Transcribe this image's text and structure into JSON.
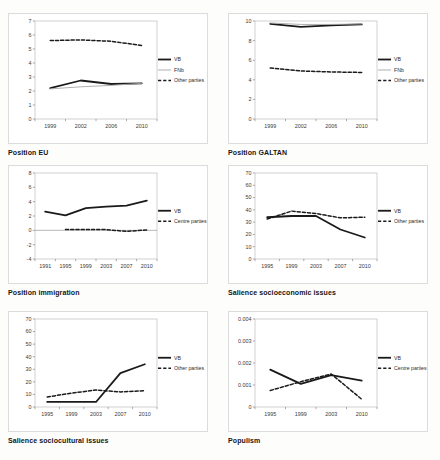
{
  "page": {
    "background_color": "#fdfdfc",
    "figure_type": "2x3 grid of line charts"
  },
  "chart_data": [
    {
      "type": "line",
      "title": "Position EU",
      "x": [
        "1999",
        "2002",
        "2006",
        "2010"
      ],
      "ylim": [
        0,
        7
      ],
      "ytick_values": [
        0,
        1,
        2,
        3,
        4,
        5,
        6,
        7
      ],
      "ytick_labels": [
        "0",
        "1",
        "2",
        "3",
        "4",
        "5",
        "6",
        "7"
      ],
      "grid": false,
      "legend_position": "right",
      "series": [
        {
          "name": "VB",
          "values": [
            2.2,
            2.75,
            2.5,
            2.55
          ],
          "color": "#1a1a1a",
          "width": 1.8,
          "dash": null
        },
        {
          "name": "FNb",
          "values": [
            2.15,
            2.3,
            2.4,
            2.55
          ],
          "color": "#a6a6a6",
          "width": 0.9,
          "dash": null
        },
        {
          "name": "Other parties",
          "values": [
            5.6,
            5.65,
            5.55,
            5.25
          ],
          "color": "#1a1a1a",
          "width": 1.5,
          "dash": "3.2,2"
        }
      ]
    },
    {
      "type": "line",
      "title": "Position GALTAN",
      "x": [
        "1999",
        "2002",
        "2006",
        "2010"
      ],
      "ylim": [
        0,
        10
      ],
      "ytick_values": [
        0,
        2,
        4,
        6,
        8,
        10
      ],
      "ytick_labels": [
        "0",
        "2",
        "4",
        "6",
        "8",
        "10"
      ],
      "grid": false,
      "legend_position": "right",
      "series": [
        {
          "name": "VB",
          "values": [
            9.7,
            9.4,
            9.55,
            9.65
          ],
          "color": "#1a1a1a",
          "width": 1.8,
          "dash": null
        },
        {
          "name": "FNb",
          "values": [
            9.8,
            9.65,
            9.65,
            9.7
          ],
          "color": "#a6a6a6",
          "width": 0.9,
          "dash": null
        },
        {
          "name": "Other parties",
          "values": [
            5.2,
            4.9,
            4.8,
            4.75
          ],
          "color": "#1a1a1a",
          "width": 1.5,
          "dash": "3.2,2"
        }
      ]
    },
    {
      "type": "line",
      "title": "Position immigration",
      "x": [
        "1991",
        "1995",
        "1999",
        "2003",
        "2007",
        "2010"
      ],
      "ylim": [
        -4,
        8
      ],
      "ytick_values": [
        -4,
        -2,
        0,
        2,
        4,
        6,
        8
      ],
      "ytick_labels": [
        "-4",
        "-2",
        "0",
        "2",
        "4",
        "6",
        "8"
      ],
      "grid": false,
      "legend_position": "right",
      "series": [
        {
          "name": "VB",
          "values": [
            2.6,
            2.1,
            3.1,
            3.3,
            3.45,
            4.15
          ],
          "color": "#1a1a1a",
          "width": 1.8,
          "dash": null
        },
        {
          "name": "Centre parties",
          "values": [
            null,
            0.1,
            0.1,
            0.1,
            -0.15,
            0.05
          ],
          "color": "#1a1a1a",
          "width": 1.5,
          "dash": "3.2,2"
        }
      ]
    },
    {
      "type": "line",
      "title": "Salience socioeconomic issues",
      "x": [
        "1995",
        "1999",
        "2003",
        "2007",
        "2010"
      ],
      "ylim": [
        0,
        70
      ],
      "ytick_values": [
        0,
        10,
        20,
        30,
        40,
        50,
        60,
        70
      ],
      "ytick_labels": [
        "0",
        "10",
        "20",
        "30",
        "40",
        "50",
        "60",
        "70"
      ],
      "grid": false,
      "legend_position": "right",
      "series": [
        {
          "name": "VB",
          "values": [
            34,
            35,
            35,
            24,
            17.5
          ],
          "color": "#1a1a1a",
          "width": 1.8,
          "dash": null
        },
        {
          "name": "Other parties",
          "values": [
            32.5,
            39,
            37,
            33.5,
            34
          ],
          "color": "#1a1a1a",
          "width": 1.5,
          "dash": "3.2,2"
        }
      ]
    },
    {
      "type": "line",
      "title": "Salience sociocultural issues",
      "x": [
        "1995",
        "1999",
        "2003",
        "2007",
        "2010"
      ],
      "ylim": [
        0,
        70
      ],
      "ytick_values": [
        0,
        10,
        20,
        30,
        40,
        50,
        60,
        70
      ],
      "ytick_labels": [
        "0",
        "10",
        "20",
        "30",
        "40",
        "50",
        "60",
        "70"
      ],
      "grid": false,
      "legend_position": "right",
      "series": [
        {
          "name": "VB",
          "values": [
            4,
            4,
            4,
            27,
            34
          ],
          "color": "#1a1a1a",
          "width": 1.8,
          "dash": null
        },
        {
          "name": "Other parties",
          "values": [
            8,
            11,
            13.5,
            12,
            13
          ],
          "color": "#1a1a1a",
          "width": 1.5,
          "dash": "3.2,2"
        }
      ]
    },
    {
      "type": "line",
      "title": "Populism",
      "x": [
        "1995",
        "1999",
        "2003",
        "2010"
      ],
      "ylim": [
        0,
        0.004
      ],
      "ytick_values": [
        0,
        0.001,
        0.002,
        0.003,
        0.004
      ],
      "ytick_labels": [
        "0",
        "0.001",
        "0.002",
        "0.003",
        "0.004"
      ],
      "grid": false,
      "legend_position": "right",
      "series": [
        {
          "name": "VB",
          "values": [
            0.0017,
            0.00105,
            0.00145,
            0.0012
          ],
          "color": "#1a1a1a",
          "width": 1.8,
          "dash": null
        },
        {
          "name": "Centre parties",
          "values": [
            0.00075,
            0.00115,
            0.0015,
            0.00035
          ],
          "color": "#1a1a1a",
          "width": 1.5,
          "dash": "3.2,2"
        }
      ]
    }
  ]
}
